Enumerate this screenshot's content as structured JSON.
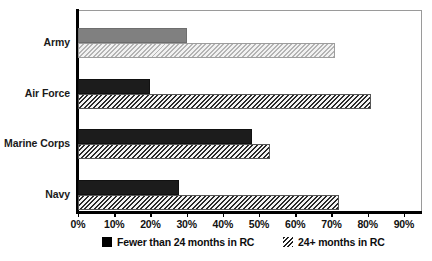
{
  "chart_data": {
    "type": "bar",
    "orientation": "horizontal",
    "title": "",
    "xlabel": "",
    "ylabel": "",
    "xlim": [
      0,
      95
    ],
    "xticks": [
      0,
      10,
      20,
      30,
      40,
      50,
      60,
      70,
      80,
      90
    ],
    "xtick_labels": [
      "0%",
      "10%",
      "20%",
      "30%",
      "40%",
      "50%",
      "60%",
      "70%",
      "80%",
      "90%"
    ],
    "grid": false,
    "legend_position": "bottom",
    "categories": [
      "Army",
      "Air Force",
      "Marine Corps",
      "Navy"
    ],
    "series": [
      {
        "name": "Fewer than 24 months in RC",
        "pattern": "solid",
        "values": [
          30,
          20,
          48,
          28
        ]
      },
      {
        "name": "24+ months in RC",
        "pattern": "diagonal-hatch",
        "values": [
          71,
          81,
          53,
          72
        ]
      }
    ]
  },
  "legend": {
    "items": [
      {
        "label": "Fewer than 24 months in RC",
        "swatch": "solid-black-square"
      },
      {
        "label": "24+ months in RC",
        "swatch": "hatched-square"
      }
    ]
  },
  "colors": {
    "army_solid": "#808080",
    "army_hatch": "#b4b4b4",
    "other_solid": "#1c1c1c",
    "other_hatch": "#2a2a2a",
    "axis": "#000000",
    "frame": "#9a9a9a",
    "background": "#ffffff"
  }
}
